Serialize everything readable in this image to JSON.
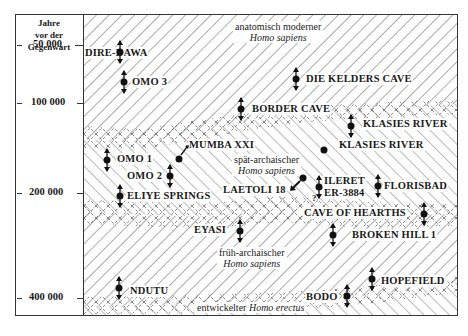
{
  "axis": {
    "title_lines": [
      "Jahre",
      "vor der",
      "Gegenwart"
    ],
    "ticks": [
      {
        "label": "50 000",
        "y": 45
      },
      {
        "label": "100 000",
        "y": 117
      },
      {
        "label": "200 000",
        "y": 207
      },
      {
        "label": "400 000",
        "y": 312
      }
    ]
  },
  "groups": {
    "modern": {
      "line1": "anatomisch moderner",
      "line2": "Homo sapiens"
    },
    "late_archaic": {
      "line1": "spät-archaischer",
      "line2": "Homo sapiens"
    },
    "early_archaic": {
      "line1": "früh-archaischer",
      "line2": "Homo sapiens"
    },
    "erectus": {
      "line1": "entwickelter",
      "line2": "Homo erectus"
    }
  },
  "sites": [
    {
      "name": "DIRE-DAWA",
      "label_x": 84,
      "label_y": 53,
      "marker_x": 115,
      "marker_y": 46,
      "marker": "range"
    },
    {
      "name": "DIE KELDERS CAVE",
      "label_x": 315,
      "label_y": 78,
      "marker_x": 292,
      "marker_y": 72,
      "marker": "range"
    },
    {
      "name": "OMO 3",
      "label_x": 133,
      "label_y": 82,
      "marker_x": 121,
      "marker_y": 75,
      "marker": "range"
    },
    {
      "name": "BORDER CAVE",
      "label_x": 255,
      "label_y": 109,
      "marker_x": 240,
      "marker_y": 103,
      "marker": "range"
    },
    {
      "name": "KLASIES RIVER",
      "label_x": 360,
      "label_y": 124,
      "marker_x": 346,
      "marker_y": 118,
      "marker": "range"
    },
    {
      "name": "MUMBA XXI",
      "label_x": 188,
      "label_y": 145,
      "marker_x": 177,
      "marker_y": 161,
      "marker": "point-arrow"
    },
    {
      "name": "KLASIES RIVER",
      "label_x": 338,
      "label_y": 144,
      "marker_x": 325,
      "marker_y": 149,
      "marker": "point"
    },
    {
      "name": "OMO 1",
      "label_x": 116,
      "label_y": 160,
      "marker_x": 106,
      "marker_y": 154,
      "marker": "range"
    },
    {
      "name": "OMO 2",
      "label_x": 127,
      "label_y": 177,
      "marker_x": 170,
      "marker_y": 171,
      "marker": "range"
    },
    {
      "name": "LAETOLI 18",
      "label_x": 220,
      "label_y": 190,
      "marker_x": 300,
      "marker_y": 176,
      "marker": "point-arrow"
    },
    {
      "name": "ILERET",
      "label_x": 334,
      "label_y": 179,
      "marker_x": 318,
      "marker_y": 182,
      "marker": "range"
    },
    {
      "name": "ER-3884",
      "label_x": 334,
      "label_y": 191,
      "marker_x": 318,
      "marker_y": 182,
      "marker": "range"
    },
    {
      "name": "FLORISBAD",
      "label_x": 384,
      "label_y": 185,
      "marker_x": 373,
      "marker_y": 179,
      "marker": "range"
    },
    {
      "name": "ELIYE SPRINGS",
      "label_x": 128,
      "label_y": 196,
      "marker_x": 120,
      "marker_y": 189,
      "marker": "range"
    },
    {
      "name": "CAVE OF HEARTHS",
      "label_x": 296,
      "label_y": 213,
      "marker_x": 423,
      "marker_y": 207,
      "marker": "range"
    },
    {
      "name": "EYASI",
      "label_x": 204,
      "label_y": 231,
      "marker_x": 240,
      "marker_y": 225,
      "marker": "range"
    },
    {
      "name": "BROKEN HILL 1",
      "label_x": 351,
      "label_y": 235,
      "marker_x": 334,
      "marker_y": 225,
      "marker": "range"
    },
    {
      "name": "NDUTU",
      "label_x": 128,
      "label_y": 286,
      "marker_x": 119,
      "marker_y": 280,
      "marker": "range"
    },
    {
      "name": "HOPEFIELD",
      "label_x": 380,
      "label_y": 278,
      "marker_x": 372,
      "marker_y": 271,
      "marker": "range"
    },
    {
      "name": "BODO",
      "label_x": 310,
      "label_y": 291,
      "marker_x": 346,
      "marker_y": 286,
      "marker": "range"
    }
  ],
  "uncertain_mark": "?"
}
